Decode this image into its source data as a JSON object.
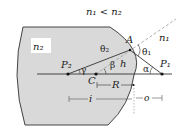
{
  "diagram": {
    "condition": "n₁ < n₂",
    "media": {
      "inside": "n₂",
      "outside": "n₁"
    },
    "points": {
      "object": "P₁",
      "image": "P₂",
      "center": "C",
      "incidence": "A"
    },
    "angles": {
      "incidence": "θ₁",
      "refraction": "θ₂",
      "alpha": "α",
      "beta": "β",
      "gamma": "γ"
    },
    "lengths": {
      "height": "h",
      "radius": "R",
      "image_distance": "i",
      "object_distance": "o"
    },
    "colors": {
      "glass_fill": "#d9d9d9",
      "outline": "#444444",
      "ray": "#333333",
      "normal_dashed": "#999999"
    }
  }
}
